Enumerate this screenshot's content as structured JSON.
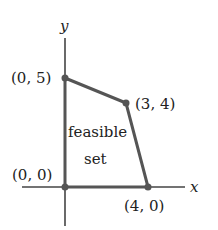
{
  "axes": {
    "x_label": "x",
    "y_label": "y"
  },
  "region": {
    "label_line1": "feasible",
    "label_line2": "set"
  },
  "vertices": [
    {
      "label": "(0, 5)",
      "px": 65,
      "py": 78
    },
    {
      "label": "(3, 4)",
      "px": 126,
      "py": 103
    },
    {
      "label": "(4, 0)",
      "px": 148,
      "py": 187
    },
    {
      "label": "(0, 0)",
      "px": 65,
      "py": 187
    }
  ],
  "colors": {
    "axis": "#444444",
    "polygon": "#555555",
    "text": "#222222"
  }
}
